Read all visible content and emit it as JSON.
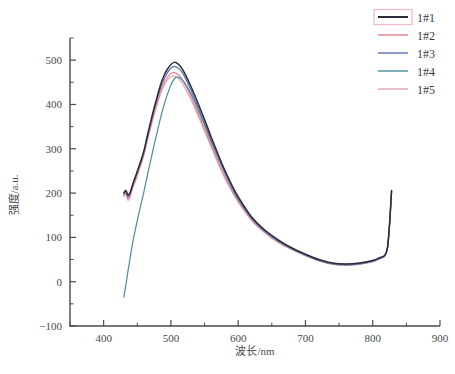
{
  "chart_data": {
    "type": "line",
    "title": "",
    "xlabel": "波长/nm",
    "ylabel": "强度/a.u.",
    "xlim": [
      350,
      900
    ],
    "ylim": [
      -100,
      550
    ],
    "xticks": [
      400,
      500,
      600,
      700,
      800,
      900
    ],
    "xtick_labels": [
      "400",
      "500",
      "600",
      "700",
      "800",
      "900"
    ],
    "yticks": [
      -100,
      0,
      100,
      200,
      300,
      400,
      500
    ],
    "ytick_labels": [
      "−100",
      "0",
      "100",
      "200",
      "300",
      "400",
      "500"
    ],
    "x_minor_step": 50,
    "y_minor_step": 50,
    "grid": false,
    "legend_position": "top-right",
    "x": [
      430,
      433,
      436,
      439,
      442,
      445,
      448,
      452,
      456,
      460,
      465,
      470,
      475,
      480,
      485,
      490,
      495,
      500,
      505,
      510,
      515,
      520,
      530,
      540,
      550,
      560,
      570,
      580,
      590,
      600,
      620,
      640,
      660,
      680,
      700,
      720,
      740,
      760,
      780,
      800,
      810,
      818,
      822,
      825,
      827,
      828
    ],
    "series": [
      {
        "name": "1#1",
        "color": "#2b2b3c",
        "selected": true,
        "values": [
          200,
          206,
          196,
          200,
          214,
          228,
          240,
          258,
          276,
          296,
          330,
          362,
          392,
          420,
          446,
          466,
          480,
          490,
          495,
          492,
          484,
          472,
          440,
          404,
          366,
          326,
          288,
          252,
          220,
          192,
          146,
          116,
          94,
          76,
          62,
          50,
          42,
          40,
          42,
          48,
          54,
          60,
          78,
          130,
          180,
          206
        ]
      },
      {
        "name": "1#2",
        "color": "#e8808a",
        "selected": false,
        "values": [
          196,
          202,
          188,
          194,
          208,
          222,
          234,
          252,
          270,
          290,
          322,
          352,
          382,
          408,
          432,
          450,
          462,
          470,
          472,
          468,
          460,
          448,
          418,
          382,
          346,
          308,
          272,
          238,
          208,
          182,
          140,
          112,
          90,
          74,
          60,
          48,
          40,
          38,
          40,
          46,
          52,
          58,
          76,
          128,
          178,
          204
        ]
      },
      {
        "name": "1#3",
        "color": "#5a6fb0",
        "selected": false,
        "values": [
          198,
          204,
          192,
          198,
          212,
          226,
          238,
          256,
          274,
          294,
          326,
          358,
          388,
          414,
          440,
          458,
          472,
          482,
          486,
          483,
          476,
          464,
          432,
          396,
          358,
          320,
          282,
          248,
          216,
          188,
          144,
          114,
          92,
          75,
          61,
          49,
          41,
          39,
          41,
          47,
          53,
          59,
          77,
          129,
          179,
          205
        ]
      },
      {
        "name": "1#4",
        "color": "#4a8f9a",
        "selected": false,
        "values": [
          -35,
          -8,
          22,
          50,
          78,
          102,
          124,
          152,
          178,
          204,
          240,
          274,
          308,
          340,
          372,
          400,
          424,
          444,
          458,
          462,
          458,
          450,
          424,
          390,
          354,
          316,
          280,
          246,
          214,
          186,
          143,
          113,
          91,
          74,
          60,
          48,
          40,
          38,
          40,
          46,
          52,
          58,
          76,
          128,
          178,
          204
        ]
      },
      {
        "name": "1#5",
        "color": "#e0a0b4",
        "selected": false,
        "values": [
          192,
          198,
          184,
          190,
          204,
          218,
          230,
          248,
          266,
          286,
          318,
          348,
          376,
          402,
          426,
          444,
          456,
          462,
          464,
          460,
          452,
          440,
          410,
          376,
          340,
          304,
          268,
          234,
          206,
          180,
          138,
          110,
          88,
          72,
          58,
          47,
          39,
          37,
          39,
          45,
          51,
          57,
          75,
          127,
          177,
          203
        ]
      }
    ]
  },
  "legend": {
    "items": [
      {
        "label": "1#1",
        "color": "#2b2b3c"
      },
      {
        "label": "1#2",
        "color": "#e8808a"
      },
      {
        "label": "1#3",
        "color": "#5a6fb0"
      },
      {
        "label": "1#4",
        "color": "#4a8f9a"
      },
      {
        "label": "1#5",
        "color": "#e0a0b4"
      }
    ],
    "selection_box_color": "#f0b8c4"
  }
}
